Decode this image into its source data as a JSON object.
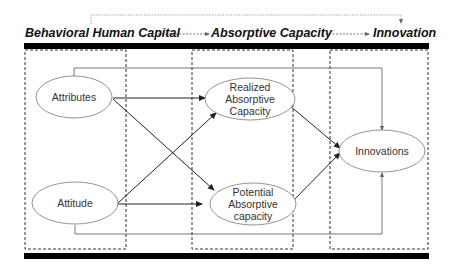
{
  "header": {
    "stage1": "Behavioral Human Capital",
    "stage2": "Absorptive Capacity",
    "stage3": "Innovation"
  },
  "nodes": {
    "attributes": "Attributes",
    "attitude": "Attitude",
    "realized": [
      "Realized",
      "Absorptive",
      "Capacity"
    ],
    "potential": [
      "Potential",
      "Absorptive",
      "capacity"
    ],
    "innovations": "Innovations"
  },
  "edges": [
    {
      "from": "Attributes",
      "to": "Realized Absorptive Capacity"
    },
    {
      "from": "Attributes",
      "to": "Potential Absorptive capacity"
    },
    {
      "from": "Attitude",
      "to": "Realized Absorptive Capacity"
    },
    {
      "from": "Attitude",
      "to": "Potential Absorptive capacity"
    },
    {
      "from": "Realized Absorptive Capacity",
      "to": "Innovations"
    },
    {
      "from": "Potential Absorptive capacity",
      "to": "Innovations"
    },
    {
      "from": "Attributes",
      "to": "Innovations",
      "style": "elbow-top"
    },
    {
      "from": "Attitude",
      "to": "Innovations",
      "style": "elbow-bottom"
    },
    {
      "from": "Behavioral Human Capital",
      "to": "Innovation",
      "style": "dotted-bracket"
    }
  ],
  "colors": {
    "line": "#333333",
    "bar": "#000000",
    "ellipse_stroke": "#777777"
  }
}
